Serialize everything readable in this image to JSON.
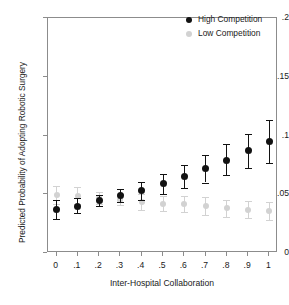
{
  "chart_data": {
    "type": "scatter",
    "title": "",
    "xlabel": "Inter-Hospital Collaboration",
    "ylabel": "Predicted Probability of Adopting Robotic Surgery",
    "x": [
      0,
      0.1,
      0.2,
      0.3,
      0.4,
      0.5,
      0.6,
      0.7,
      0.8,
      0.9,
      1
    ],
    "xtick_labels": [
      "0",
      ".1",
      ".2",
      ".3",
      ".4",
      ".5",
      ".6",
      ".7",
      ".8",
      ".9",
      "1"
    ],
    "ytick_labels": [
      ".2",
      ".15",
      ".1",
      ".05",
      "0"
    ],
    "ytick_values": [
      0.2,
      0.15,
      0.1,
      0.05,
      0
    ],
    "xlim": [
      -0.04,
      1.04
    ],
    "ylim": [
      0,
      0.2
    ],
    "grid": false,
    "legend_position": "top-right",
    "error_bars": "95% confidence interval",
    "series": [
      {
        "name": "High Competition",
        "marker": "filled-circle",
        "color": "#121212",
        "values": [
          0.037,
          0.04,
          0.0445,
          0.049,
          0.053,
          0.059,
          0.065,
          0.072,
          0.079,
          0.087,
          0.095
        ],
        "ci_lower": [
          0.029,
          0.034,
          0.04,
          0.0435,
          0.0455,
          0.05,
          0.055,
          0.06,
          0.066,
          0.072,
          0.077
        ],
        "ci_upper": [
          0.045,
          0.047,
          0.049,
          0.0545,
          0.0605,
          0.0675,
          0.0745,
          0.0835,
          0.0925,
          0.1015,
          0.1135
        ]
      },
      {
        "name": "Low Competition",
        "marker": "filled-circle",
        "color": "#d2d2d2",
        "values": [
          0.0495,
          0.0485,
          0.047,
          0.0455,
          0.0435,
          0.042,
          0.0415,
          0.04,
          0.038,
          0.037,
          0.036
        ],
        "ci_lower": [
          0.042,
          0.0415,
          0.042,
          0.0405,
          0.0365,
          0.0355,
          0.0345,
          0.0325,
          0.031,
          0.0295,
          0.0285
        ],
        "ci_upper": [
          0.057,
          0.056,
          0.052,
          0.0505,
          0.0505,
          0.0485,
          0.0485,
          0.0475,
          0.045,
          0.0445,
          0.0435
        ]
      }
    ]
  },
  "legend": {
    "items": [
      {
        "label": "High Competition"
      },
      {
        "label": "Low Competition"
      }
    ]
  }
}
